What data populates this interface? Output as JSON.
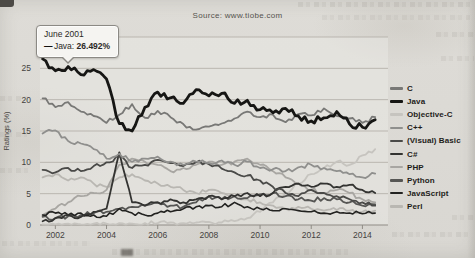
{
  "header": {
    "source": "Source: www.tiobe.com"
  },
  "tooltip": {
    "line1": "June 2001",
    "marker": "—",
    "label": "Java:",
    "value": "26.492%"
  },
  "axes": {
    "y_label": "Ratings (%)",
    "y_ticks": [
      0,
      5,
      10,
      15,
      20,
      25
    ],
    "x_ticks": [
      2002,
      2004,
      2006,
      2008,
      2010,
      2012,
      2014
    ]
  },
  "chart_data": {
    "type": "line",
    "title": "",
    "xlabel": "",
    "ylabel": "Ratings (%)",
    "xlim": [
      2001.4,
      2015.0
    ],
    "ylim": [
      0,
      30
    ],
    "grid": true,
    "legend_position": "right",
    "x": [
      2001.5,
      2002,
      2002.5,
      2003,
      2003.5,
      2004,
      2004.5,
      2005,
      2005.5,
      2006,
      2006.5,
      2007,
      2007.5,
      2008,
      2008.5,
      2009,
      2009.5,
      2010,
      2010.5,
      2011,
      2011.5,
      2012,
      2012.5,
      2013,
      2013.5,
      2014,
      2014.5
    ],
    "series": [
      {
        "name": "C",
        "color": "#787876",
        "width": 1.8,
        "z": 9,
        "values": [
          20.2,
          18.8,
          19.6,
          18.1,
          17.4,
          16.3,
          17.6,
          19.3,
          17.1,
          18.2,
          17.2,
          16.1,
          15.2,
          15.7,
          16.2,
          17.0,
          18.1,
          17.2,
          17.6,
          16.4,
          17.7,
          17.5,
          18.6,
          17.4,
          17.0,
          16.3,
          17.2
        ]
      },
      {
        "name": "Java",
        "color": "#161614",
        "width": 2.8,
        "z": 10,
        "values": [
          26.5,
          24.6,
          25.3,
          24.0,
          24.8,
          23.3,
          16.2,
          15.0,
          18.8,
          21.2,
          20.3,
          19.4,
          21.6,
          20.6,
          21.0,
          19.4,
          19.9,
          18.4,
          17.9,
          18.6,
          17.4,
          16.6,
          17.1,
          18.1,
          16.1,
          15.6,
          16.8
        ]
      },
      {
        "name": "Objective-C",
        "color": "#c6c4bf",
        "width": 1.8,
        "z": 1,
        "values": [
          0.1,
          0.1,
          0.2,
          0.1,
          0.2,
          0.2,
          0.3,
          0.2,
          0.3,
          0.3,
          0.4,
          0.3,
          0.4,
          0.5,
          0.4,
          0.6,
          1.1,
          2.1,
          3.6,
          5.1,
          6.6,
          8.1,
          9.1,
          10.1,
          9.6,
          11.1,
          12.1
        ]
      },
      {
        "name": "C++",
        "color": "#8f8f8d",
        "width": 1.8,
        "z": 8,
        "values": [
          14.6,
          15.1,
          13.4,
          13.0,
          12.1,
          10.6,
          11.4,
          10.1,
          10.6,
          10.9,
          10.1,
          9.6,
          10.1,
          9.9,
          10.3,
          9.6,
          10.1,
          9.1,
          8.9,
          8.6,
          9.2,
          9.6,
          9.1,
          8.6,
          8.1,
          7.6,
          8.2
        ]
      },
      {
        "name": "(Visual) Basic",
        "color": "#4a4a48",
        "width": 1.8,
        "z": 7,
        "values": [
          8.8,
          8.4,
          9.1,
          8.6,
          9.4,
          10.0,
          10.9,
          9.1,
          9.6,
          10.4,
          9.9,
          9.4,
          10.0,
          9.7,
          9.0,
          8.4,
          7.9,
          7.1,
          6.1,
          5.1,
          4.6,
          5.6,
          5.1,
          4.6,
          4.1,
          3.6,
          3.1
        ]
      },
      {
        "name": "C#",
        "color": "#333331",
        "width": 1.8,
        "z": 6,
        "values": [
          0.6,
          1.1,
          1.6,
          1.3,
          2.1,
          2.6,
          11.6,
          3.6,
          3.1,
          3.6,
          4.1,
          3.6,
          4.1,
          4.6,
          4.1,
          4.6,
          5.1,
          4.6,
          5.1,
          6.1,
          6.6,
          6.1,
          6.6,
          6.1,
          6.4,
          5.6,
          5.1
        ]
      },
      {
        "name": "PHP",
        "color": "#a8a6a2",
        "width": 1.8,
        "z": 3,
        "values": [
          1.6,
          2.6,
          3.6,
          4.6,
          5.1,
          5.6,
          9.6,
          10.6,
          10.1,
          9.6,
          8.6,
          9.1,
          9.6,
          10.1,
          9.6,
          10.1,
          10.6,
          9.6,
          8.6,
          7.6,
          6.6,
          5.6,
          5.1,
          5.6,
          5.1,
          4.1,
          3.6
        ]
      },
      {
        "name": "Python",
        "color": "#565654",
        "width": 1.8,
        "z": 4,
        "values": [
          1.3,
          1.1,
          1.4,
          1.6,
          1.9,
          2.1,
          2.6,
          2.9,
          3.1,
          3.6,
          3.1,
          2.9,
          3.6,
          4.6,
          4.1,
          4.6,
          4.3,
          4.9,
          5.1,
          4.6,
          4.1,
          3.9,
          4.3,
          4.1,
          3.6,
          3.1,
          3.3
        ]
      },
      {
        "name": "JavaScript",
        "color": "#222220",
        "width": 1.6,
        "z": 5,
        "values": [
          1.6,
          1.9,
          1.6,
          1.9,
          1.6,
          1.4,
          2.6,
          1.9,
          1.6,
          1.9,
          2.1,
          2.6,
          2.9,
          3.1,
          2.9,
          3.6,
          2.9,
          2.6,
          2.3,
          2.6,
          2.3,
          2.1,
          1.9,
          2.1,
          1.9,
          1.8,
          1.9
        ]
      },
      {
        "name": "Perl",
        "color": "#b9b7b2",
        "width": 1.8,
        "z": 2,
        "values": [
          7.6,
          8.1,
          7.1,
          7.6,
          6.6,
          6.1,
          7.6,
          8.1,
          7.1,
          6.6,
          6.1,
          5.6,
          5.1,
          5.6,
          5.1,
          4.6,
          4.1,
          3.6,
          3.1,
          2.6,
          2.9,
          2.6,
          2.3,
          2.4,
          2.3,
          2.1,
          2.3
        ]
      }
    ]
  }
}
